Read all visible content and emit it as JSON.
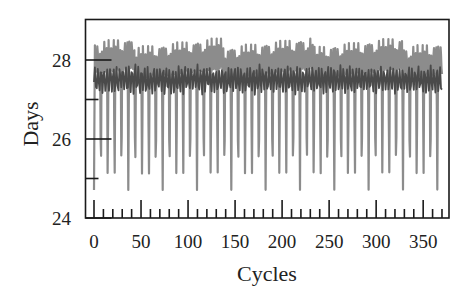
{
  "chart_data": {
    "type": "line",
    "title": "",
    "xlabel": "Cycles",
    "ylabel": "Days",
    "xlim": [
      -10,
      377
    ],
    "ylim": [
      24,
      29.05
    ],
    "x_ticks_major": [
      0,
      50,
      100,
      150,
      200,
      250,
      300,
      350
    ],
    "x_tick_labels": [
      "0",
      "50",
      "100",
      "150",
      "200",
      "250",
      "300",
      "350"
    ],
    "x_ticks_minor_step": 10,
    "y_ticks_major": [
      24,
      26,
      28
    ],
    "y_tick_labels": [
      "24",
      "26",
      "28"
    ],
    "y_ticks_minor": [
      25,
      27
    ],
    "grid": false,
    "legend": null,
    "series": [
      {
        "name": "light-series",
        "color": "#8c8c8c",
        "description": "High-amplitude oscillation; peaks ~28.4-28.6 days, sharp periodic dips to ~24.7-25.7 days roughly every 7.3 cycles (~51 dips over 0-370)",
        "x_range": [
          0,
          370
        ],
        "peak_range": [
          28.35,
          28.6
        ],
        "trough_range": [
          24.7,
          25.7
        ],
        "period_cycles": 7.3
      },
      {
        "name": "dark-series",
        "color": "#4a4a4a",
        "description": "Low-amplitude oscillation band between ~27.1 and ~27.9 days",
        "x_range": [
          0,
          370
        ],
        "band": [
          27.1,
          27.9
        ],
        "mean": 27.5
      }
    ]
  }
}
